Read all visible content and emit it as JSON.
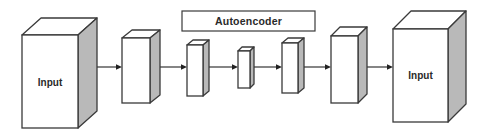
{
  "diagram": {
    "title": "Autoencoder",
    "nodes": [
      {
        "id": "input",
        "label": "Input",
        "role": "input layer"
      },
      {
        "id": "layer1",
        "label": "",
        "role": "hidden layer"
      },
      {
        "id": "encoder",
        "label": "",
        "role": "autoencoder layer"
      },
      {
        "id": "bottleneck",
        "label": "",
        "role": "autoencoder bottleneck"
      },
      {
        "id": "decoder",
        "label": "",
        "role": "autoencoder layer"
      },
      {
        "id": "layer5",
        "label": "",
        "role": "hidden layer"
      },
      {
        "id": "output",
        "label": "Input",
        "role": "reconstructed output"
      }
    ],
    "edges": [
      {
        "from": "input",
        "to": "layer1"
      },
      {
        "from": "layer1",
        "to": "encoder"
      },
      {
        "from": "encoder",
        "to": "bottleneck"
      },
      {
        "from": "bottleneck",
        "to": "decoder"
      },
      {
        "from": "decoder",
        "to": "layer5"
      },
      {
        "from": "layer5",
        "to": "output"
      }
    ],
    "group": {
      "label": "Autoencoder",
      "spans": [
        "encoder",
        "bottleneck",
        "decoder"
      ]
    },
    "colors": {
      "stroke": "#3a3a3a",
      "front_face": "#ffffff",
      "side_face": "#b9b9b9",
      "background": "#ffffff"
    }
  }
}
